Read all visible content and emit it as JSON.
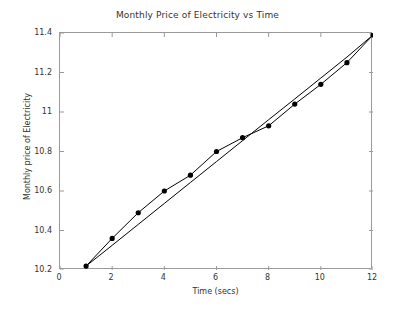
{
  "chart_data": {
    "type": "line",
    "title": "Monthly Price of Electricity vs Time",
    "xlabel": "Time (secs)",
    "ylabel": "Monthly price of Electricity",
    "xlim": [
      0,
      12
    ],
    "ylim": [
      10.2,
      11.4
    ],
    "xticks": [
      0,
      2,
      4,
      6,
      8,
      10,
      12
    ],
    "xtick_labels": [
      "0",
      "2",
      "4",
      "6",
      "8",
      "10",
      "12"
    ],
    "yticks": [
      10.2,
      10.4,
      10.6,
      10.8,
      11,
      11.2,
      11.4
    ],
    "ytick_labels": [
      "10.2",
      "10.4",
      "10.6",
      "10.8",
      "11",
      "11.2",
      "11.4"
    ],
    "grid": false,
    "legend": null,
    "x": [
      1,
      2,
      3,
      4,
      5,
      6,
      7,
      8,
      9,
      10,
      11,
      12
    ],
    "series": [
      {
        "name": "Monthly price of electricity",
        "marker": "filled-circle",
        "marker_color": "#000000",
        "line_color": "#000000",
        "values": [
          10.22,
          10.36,
          10.49,
          10.6,
          10.68,
          10.8,
          10.87,
          10.93,
          11.04,
          11.14,
          11.25,
          11.39
        ]
      },
      {
        "name": "Trend line",
        "marker": "none",
        "marker_color": "#000000",
        "line_color": "#000000",
        "values": [
          10.22,
          10.325,
          10.431,
          10.537,
          10.643,
          10.749,
          10.855,
          10.961,
          11.066,
          11.172,
          11.278,
          11.39
        ]
      }
    ]
  },
  "figure": {
    "background_color": "#ffffff",
    "axis_color": "#9a9a9a",
    "text_color": "#333333"
  }
}
